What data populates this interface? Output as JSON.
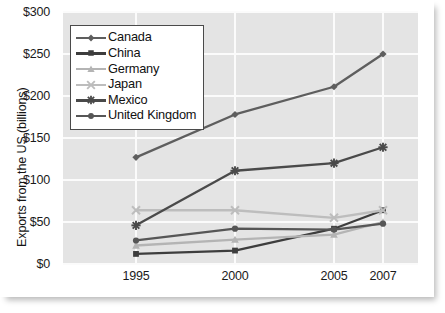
{
  "chart_data": {
    "type": "line",
    "title": "",
    "xlabel": "",
    "ylabel": "Exports from the US (billions)",
    "x": [
      "1995",
      "2000",
      "2005",
      "2007"
    ],
    "categories": [
      "1995",
      "2000",
      "2005",
      "2007"
    ],
    "ylim": [
      0,
      300
    ],
    "yticks": [
      "$0",
      "$50",
      "$100",
      "$150",
      "$200",
      "$250",
      "$300"
    ],
    "ytick_values": [
      0,
      50,
      100,
      150,
      200,
      250,
      300
    ],
    "grid": true,
    "legend_position": "upper-left-inside",
    "series": [
      {
        "name": "Canada",
        "marker": "diamond",
        "color": "#5e5e5e",
        "values": [
          127,
          178,
          211,
          250
        ]
      },
      {
        "name": "China",
        "marker": "square",
        "color": "#3d3d3d",
        "values": [
          12,
          16,
          42,
          64
        ]
      },
      {
        "name": "Germany",
        "marker": "triangle",
        "color": "#b4b4b4",
        "values": [
          22,
          29,
          35,
          50
        ]
      },
      {
        "name": "Japan",
        "marker": "cross-x",
        "color": "#bdbdbd",
        "values": [
          64,
          64,
          55,
          64
        ]
      },
      {
        "name": "Mexico",
        "marker": "asterisk",
        "color": "#4a4a4a",
        "values": [
          46,
          111,
          120,
          139
        ]
      },
      {
        "name": "United Kingdom",
        "marker": "circle",
        "color": "#565656",
        "values": [
          28,
          42,
          41,
          48
        ]
      }
    ]
  },
  "axis": {
    "y_title": "Exports from the US (billions)"
  }
}
